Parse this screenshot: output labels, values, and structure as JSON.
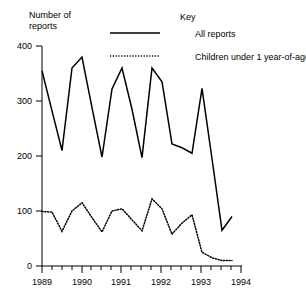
{
  "ylabel_line1": "Number of",
  "ylabel_line2": "reports",
  "legend": {
    "title": "Key",
    "solid_label": "All reports",
    "dotted_label": "Children under 1 year-of-age"
  },
  "yticks": [
    "400",
    "300",
    "200",
    "100",
    "0"
  ],
  "xticks": [
    "1989",
    "1990",
    "1991",
    "1992",
    "1993",
    "1994"
  ],
  "chart_data": {
    "type": "line",
    "title": "",
    "xlabel": "",
    "ylabel": "Number of reports",
    "xlim": [
      1989,
      1994
    ],
    "ylim": [
      0,
      400
    ],
    "ytick_values": [
      0,
      100,
      200,
      300,
      400
    ],
    "xtick_values": [
      1989,
      1990,
      1991,
      1992,
      1993,
      1994
    ],
    "minor_xticks_per_year": 4,
    "grid": false,
    "legend_position": "top-right",
    "legend_title": "Key",
    "series": [
      {
        "name": "All reports",
        "style": "solid",
        "color": "#000000",
        "x": [
          1989.0,
          1989.25,
          1989.5,
          1989.75,
          1990.0,
          1990.25,
          1990.5,
          1990.75,
          1991.0,
          1991.25,
          1991.5,
          1991.75,
          1992.0,
          1992.25,
          1992.5,
          1992.75,
          1993.0,
          1993.25,
          1993.5,
          1993.75
        ],
        "values": [
          355,
          282,
          210,
          360,
          380,
          288,
          198,
          322,
          360,
          285,
          197,
          360,
          335,
          222,
          215,
          205,
          323,
          195,
          65,
          90
        ]
      },
      {
        "name": "Children under 1 year-of-age",
        "style": "dotted",
        "color": "#000000",
        "x": [
          1989.0,
          1989.25,
          1989.5,
          1989.75,
          1990.0,
          1990.25,
          1990.5,
          1990.75,
          1991.0,
          1991.25,
          1991.5,
          1991.75,
          1992.0,
          1992.25,
          1992.5,
          1992.75,
          1993.0,
          1993.25,
          1993.5,
          1993.75
        ],
        "values": [
          99,
          98,
          63,
          100,
          115,
          88,
          62,
          100,
          104,
          84,
          64,
          122,
          104,
          58,
          78,
          93,
          25,
          15,
          10,
          10
        ]
      }
    ]
  }
}
